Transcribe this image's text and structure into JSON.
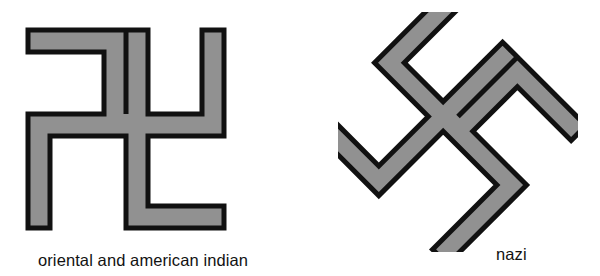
{
  "page": {
    "background_color": "#ffffff",
    "width": 600,
    "height": 276
  },
  "style": {
    "fill_color": "#919191",
    "outline_color": "#111111",
    "text_color": "#121212"
  },
  "figure": {
    "panels": [
      {
        "id": "oriental",
        "caption": "oriental and american indian",
        "symbol_name": "swastika-left-facing",
        "rotation_degrees": 0,
        "arm_direction": "counterclockwise",
        "fill_color": "#919191",
        "outline_color": "#111111"
      },
      {
        "id": "nazi",
        "caption": "nazi",
        "symbol_name": "swastika-right-facing-rotated",
        "rotation_degrees": 45,
        "arm_direction": "clockwise",
        "fill_color": "#919191",
        "outline_color": "#111111"
      }
    ]
  },
  "captions": {
    "oriental": "oriental and american indian",
    "nazi": "nazi"
  }
}
